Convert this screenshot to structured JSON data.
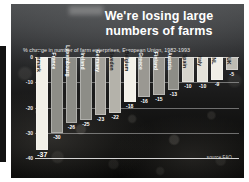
{
  "slide": {
    "title": "We're losing large numbers of farms",
    "title_line1": "We're losing large",
    "title_line2": "numbers of farms",
    "source_note": "source FAO",
    "background_style": "dark-rocky-photo"
  },
  "chart_data": {
    "type": "bar",
    "title": "% change in number of farm enterprises, European Union, 1982-1993",
    "subtitle": "% change in number of farm enterprises, European Union, 1982-1993",
    "xlabel": "",
    "ylabel": "",
    "ylim": [
      -40,
      0
    ],
    "yticks": [
      0,
      -10,
      -20,
      -30,
      -40
    ],
    "ytick_labels": [
      "0",
      "-10",
      "-20",
      "-30",
      "-40"
    ],
    "grid": true,
    "legend": "none",
    "categories": [
      "Denmark",
      "France",
      "Luxembourg",
      "Ireland",
      "Germany",
      "Sweden",
      "Belgium",
      "Greece",
      "Finland",
      "Austria",
      "Spain",
      "Italy",
      "NL",
      "UK"
    ],
    "values": [
      -37,
      -30,
      -26,
      -25,
      -23,
      -22,
      -18,
      -16,
      -15,
      -13,
      -10,
      -10,
      -9,
      -5
    ],
    "value_labels": [
      "-37",
      "-30",
      "-26",
      "-25",
      "-23",
      "-22",
      "-18",
      "-16",
      "-15",
      "-13",
      "-10",
      "-10",
      "-9",
      "-5"
    ],
    "bar_colors": [
      "#f2f0e8",
      "#8d8d87",
      "#8d8d87",
      "#8d8d87",
      "#a2a099",
      "#b4b2aa",
      "#f2f0e8",
      "#9a9892",
      "#9a9892",
      "#8d8d87",
      "#d6d4cc",
      "#e4e2da",
      "#f0eee6",
      "#bdbbb3"
    ],
    "label_colors": [
      "#1a1a1a",
      "#ffffff",
      "#ffffff",
      "#ffffff",
      "#ffffff",
      "#1a1a1a",
      "#1a1a1a",
      "#ffffff",
      "#ffffff",
      "#ffffff",
      "#1a1a1a",
      "#1a1a1a",
      "#1a1a1a",
      "#1a1a1a"
    ]
  }
}
